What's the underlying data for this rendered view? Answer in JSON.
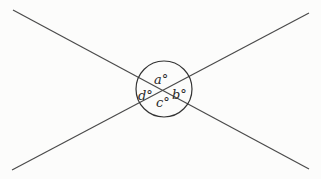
{
  "diagram": {
    "colors": {
      "line": "#4a4a4a",
      "circle": "#333333",
      "text": "#2a2a2a",
      "background": "#fcfcfb"
    },
    "lines": [
      {
        "name": "line-1",
        "x1": 13,
        "y1": 10,
        "x2": 309,
        "y2": 169
      },
      {
        "name": "line-2",
        "x1": 12,
        "y1": 170,
        "x2": 309,
        "y2": 13
      }
    ],
    "circle": {
      "cx": 164,
      "cy": 89,
      "r": 28
    },
    "labels": {
      "a": {
        "text": "a°",
        "x": 154,
        "y": 84
      },
      "b": {
        "text": "b°",
        "x": 172,
        "y": 99
      },
      "c": {
        "text": "c°",
        "x": 156,
        "y": 107
      },
      "d": {
        "text": "d°",
        "x": 138,
        "y": 100
      }
    }
  }
}
